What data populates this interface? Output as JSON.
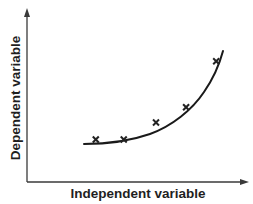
{
  "chart_data": {
    "type": "scatter",
    "title": "",
    "xlabel": "Independent variable",
    "ylabel": "Dependent variable",
    "ticks": false,
    "grid": false,
    "legend": null,
    "xlim": [
      0,
      10
    ],
    "ylim": [
      0,
      10
    ],
    "series": [
      {
        "name": "observations",
        "style": "x-markers",
        "x": [
          3.2,
          4.5,
          6.0,
          7.4,
          8.8
        ],
        "y": [
          2.5,
          2.5,
          3.5,
          4.4,
          7.1
        ]
      },
      {
        "name": "fitted curve",
        "style": "line",
        "shape": "exponential",
        "x": [
          2.6,
          4.2,
          6.0,
          7.4,
          8.9
        ],
        "y": [
          2.2,
          2.4,
          3.1,
          4.4,
          7.7
        ]
      }
    ],
    "colors": {
      "axis": "#3a3a3a",
      "curve": "#1a1a1a",
      "marker": "#222222",
      "text": "#1f1f1f"
    }
  }
}
